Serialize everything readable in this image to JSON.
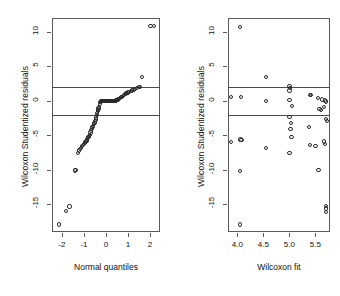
{
  "chart_data": [
    {
      "type": "scatter",
      "panel": "left",
      "title": "",
      "xlabel": "Normal quantiles",
      "ylabel": "Wilcoxon Studentized residuals",
      "xlim": [
        -2.45,
        2.45
      ],
      "ylim": [
        -19.0,
        12.0
      ],
      "xticks": [
        -2,
        -1,
        0,
        1,
        2
      ],
      "xtick_labels": [
        "-2",
        "-1",
        "0",
        "1",
        "2"
      ],
      "yticks": [
        10,
        5,
        0,
        -5,
        -10,
        -15
      ],
      "ytick_labels": [
        "10",
        "5",
        "0",
        "-5",
        "-10",
        "-15"
      ],
      "grid": false,
      "legend": "none",
      "reference_lines": [
        2,
        -2
      ],
      "marker": "open-circle",
      "points": [
        [
          -2.12,
          -17.9
        ],
        [
          -1.82,
          -16.0
        ],
        [
          -1.66,
          -15.3
        ],
        [
          -1.42,
          -10.1
        ],
        [
          -1.38,
          -10.0
        ],
        [
          -1.28,
          -7.5
        ],
        [
          -1.22,
          -7.2
        ],
        [
          -1.17,
          -7.0
        ],
        [
          -1.13,
          -6.8
        ],
        [
          -1.09,
          -6.6
        ],
        [
          -1.05,
          -6.4
        ],
        [
          -1.01,
          -6.3
        ],
        [
          -0.97,
          -6.1
        ],
        [
          -0.94,
          -6.0
        ],
        [
          -0.91,
          -5.9
        ],
        [
          -0.88,
          -5.8
        ],
        [
          -0.85,
          -5.6
        ],
        [
          -0.82,
          -5.4
        ],
        [
          -0.79,
          -5.2
        ],
        [
          -0.76,
          -5.1
        ],
        [
          -0.73,
          -4.9
        ],
        [
          -0.7,
          -4.6
        ],
        [
          -0.67,
          -4.3
        ],
        [
          -0.64,
          -4.0
        ],
        [
          -0.61,
          -3.8
        ],
        [
          -0.58,
          -3.6
        ],
        [
          -0.55,
          -3.4
        ],
        [
          -0.52,
          -3.2
        ],
        [
          -0.49,
          -3.0
        ],
        [
          -0.46,
          -2.7
        ],
        [
          -0.44,
          -2.4
        ],
        [
          -0.42,
          -2.1
        ],
        [
          -0.4,
          -1.8
        ],
        [
          -0.38,
          -1.5
        ],
        [
          -0.36,
          -1.3
        ],
        [
          -0.34,
          -1.1
        ],
        [
          -0.32,
          -1.0
        ],
        [
          -0.3,
          -0.9
        ],
        [
          -0.28,
          -0.5
        ],
        [
          -0.26,
          -0.2
        ],
        [
          -0.24,
          -0.1
        ],
        [
          -0.21,
          -0.05
        ],
        [
          -0.18,
          0.0
        ],
        [
          -0.15,
          0.0
        ],
        [
          -0.12,
          0.0
        ],
        [
          -0.09,
          0.0
        ],
        [
          -0.06,
          0.0
        ],
        [
          -0.03,
          0.0
        ],
        [
          0.0,
          0.0
        ],
        [
          0.03,
          0.0
        ],
        [
          0.06,
          0.0
        ],
        [
          0.09,
          0.0
        ],
        [
          0.12,
          0.0
        ],
        [
          0.15,
          0.0
        ],
        [
          0.18,
          0.0
        ],
        [
          0.21,
          0.0
        ],
        [
          0.24,
          0.0
        ],
        [
          0.27,
          0.0
        ],
        [
          0.3,
          0.0
        ],
        [
          0.33,
          0.0
        ],
        [
          0.36,
          0.0
        ],
        [
          0.39,
          0.0
        ],
        [
          0.42,
          0.0
        ],
        [
          0.45,
          0.05
        ],
        [
          0.48,
          0.1
        ],
        [
          0.52,
          0.15
        ],
        [
          0.56,
          0.2
        ],
        [
          0.6,
          0.3
        ],
        [
          0.64,
          0.4
        ],
        [
          0.68,
          0.5
        ],
        [
          0.72,
          0.6
        ],
        [
          0.76,
          0.7
        ],
        [
          0.8,
          0.85
        ],
        [
          0.85,
          0.95
        ],
        [
          0.9,
          1.05
        ],
        [
          0.95,
          1.1
        ],
        [
          1.0,
          1.2
        ],
        [
          1.06,
          1.3
        ],
        [
          1.12,
          1.4
        ],
        [
          1.18,
          1.5
        ],
        [
          1.25,
          1.6
        ],
        [
          1.32,
          1.75
        ],
        [
          1.4,
          1.9
        ],
        [
          1.48,
          2.0
        ],
        [
          1.56,
          2.05
        ],
        [
          1.64,
          3.5
        ],
        [
          2.02,
          10.8
        ],
        [
          2.18,
          10.8
        ]
      ]
    },
    {
      "type": "scatter",
      "panel": "right",
      "title": "",
      "xlabel": "Wilcoxon fit",
      "ylabel": "Wilcoxon Studentized residuals",
      "xlim": [
        3.82,
        5.78
      ],
      "ylim": [
        -19.0,
        12.0
      ],
      "xticks": [
        4.0,
        4.5,
        5.0,
        5.5
      ],
      "xtick_labels": [
        "4.0",
        "4.5",
        "5.0",
        "5.5"
      ],
      "yticks": [
        10,
        5,
        0,
        -5,
        -10,
        -15
      ],
      "ytick_labels": [
        "10",
        "5",
        "0",
        "-5",
        "-10",
        "-15"
      ],
      "grid": false,
      "legend": "none",
      "reference_lines": [
        2,
        -2
      ],
      "marker": "open-circle",
      "points": [
        [
          4.05,
          10.7
        ],
        [
          4.55,
          3.5
        ],
        [
          3.88,
          0.5
        ],
        [
          4.07,
          0.6
        ],
        [
          4.55,
          0.0
        ],
        [
          5.0,
          2.1
        ],
        [
          5.01,
          1.9
        ],
        [
          5.0,
          1.5
        ],
        [
          5.0,
          0.1
        ],
        [
          5.05,
          -0.8
        ],
        [
          5.4,
          0.9
        ],
        [
          5.42,
          0.8
        ],
        [
          5.55,
          0.4
        ],
        [
          5.62,
          0.2
        ],
        [
          5.68,
          0.05
        ],
        [
          5.7,
          -0.1
        ],
        [
          5.58,
          -1.2
        ],
        [
          5.6,
          -1.3
        ],
        [
          5.66,
          -0.9
        ],
        [
          5.0,
          -2.3
        ],
        [
          5.03,
          -3.2
        ],
        [
          5.02,
          -4.1
        ],
        [
          5.04,
          -5.2
        ],
        [
          5.38,
          -3.8
        ],
        [
          5.7,
          -2.6
        ],
        [
          5.72,
          -2.9
        ],
        [
          3.87,
          -6.0
        ],
        [
          4.06,
          -5.6
        ],
        [
          4.08,
          -5.7
        ],
        [
          4.55,
          -6.8
        ],
        [
          5.0,
          -7.5
        ],
        [
          5.4,
          -6.4
        ],
        [
          5.5,
          -6.6
        ],
        [
          5.66,
          -5.9
        ],
        [
          5.68,
          -6.3
        ],
        [
          4.05,
          -10.2
        ],
        [
          5.56,
          -10.0
        ],
        [
          5.7,
          -15.2
        ],
        [
          5.7,
          -15.6
        ],
        [
          5.7,
          -16.1
        ],
        [
          4.05,
          -17.9
        ]
      ]
    }
  ],
  "layout": {
    "panels": [
      {
        "name": "left-panel",
        "plot_left": 52,
        "plot_top": 18,
        "plot_width": 108,
        "plot_height": 214
      },
      {
        "name": "right-panel",
        "plot_left": 228,
        "plot_top": 18,
        "plot_width": 102,
        "plot_height": 214
      }
    ]
  }
}
